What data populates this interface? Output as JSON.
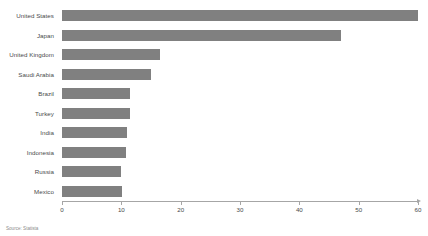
{
  "chart_data": {
    "type": "bar",
    "orientation": "horizontal",
    "title": "",
    "subtitle": "",
    "xlabel": "",
    "ylabel": "",
    "xlim": [
      0,
      60
    ],
    "xticks": [
      0,
      10,
      20,
      30,
      40,
      50,
      60
    ],
    "xtick_labels": [
      "0",
      "10",
      "20",
      "30",
      "40",
      "50",
      "60"
    ],
    "grid": false,
    "legend": null,
    "categories": [
      "United States",
      "Japan",
      "United Kingdom",
      "Saudi Arabia",
      "Brazil",
      "Turkey",
      "India",
      "Indonesia",
      "Russia",
      "Mexico"
    ],
    "values": [
      60,
      47,
      16.5,
      15,
      11.5,
      11.4,
      11,
      10.8,
      10,
      10.1
    ],
    "series": [
      {
        "name": "Value",
        "values": [
          60,
          47,
          16.5,
          15,
          11.5,
          11.4,
          11,
          10.8,
          10,
          10.1
        ]
      }
    ],
    "bar_color": "#808080",
    "axis_color": "#a6a6a6",
    "text_color": "#4a4a4a",
    "background": "#ffffff"
  },
  "footer": {
    "source": "Source: Statista"
  }
}
